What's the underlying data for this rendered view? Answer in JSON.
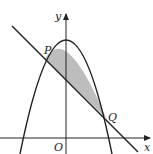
{
  "diagram": {
    "type": "coordinate-geometry",
    "axes": {
      "x_label": "x",
      "y_label": "y",
      "origin_label": "O"
    },
    "points": [
      {
        "label": "P",
        "role": "left intersection of line and parabola"
      },
      {
        "label": "Q",
        "role": "right intersection of line and parabola"
      }
    ],
    "shaded_region": "area enclosed between parabola and line from P to Q",
    "colors": {
      "stroke": "#222222",
      "shade": "#bdbdbd",
      "background": "#ffffff"
    }
  }
}
